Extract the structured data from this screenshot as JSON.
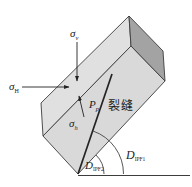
{
  "figure": {
    "labels": {
      "sigma_v": {
        "base": "σ",
        "sub": "v"
      },
      "sigma_H": {
        "base": "σ",
        "sub": "H"
      },
      "sigma_h": {
        "base": "σ",
        "sub": "h"
      },
      "pressure": {
        "base": "P",
        "sub": "p"
      },
      "crack": "裂缝",
      "dip1": {
        "base": "D",
        "sub": "IPF1"
      },
      "dip2": {
        "base": "D",
        "sub": "IPF2"
      }
    },
    "colors": {
      "background": "#ffffff",
      "face_top": "#e0e0e0",
      "face_front": "#d9d9d9",
      "face_end": "#a3a3a3",
      "edge": "#3c3c3c",
      "crack_line": "#242424",
      "arrow": "#222222",
      "text": "#1c1c1c"
    }
  }
}
